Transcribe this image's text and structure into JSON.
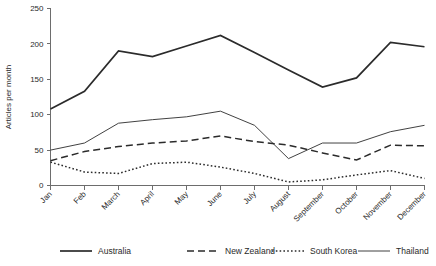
{
  "chart_data": {
    "type": "line",
    "title": "",
    "xlabel": "",
    "ylabel": "Articles per month",
    "categories": [
      "Jan",
      "Feb",
      "March",
      "April",
      "May",
      "June",
      "July",
      "August",
      "September",
      "October",
      "November",
      "December"
    ],
    "ylim": [
      0,
      250
    ],
    "yticks": [
      0,
      50,
      100,
      150,
      200,
      250
    ],
    "grid": false,
    "legend_position": "bottom",
    "series": [
      {
        "name": "Australia",
        "style": "solid-thick",
        "values": [
          108,
          133,
          190,
          182,
          197,
          212,
          188,
          163,
          139,
          152,
          202,
          196
        ]
      },
      {
        "name": "New Zealand",
        "style": "dashed",
        "values": [
          35,
          48,
          55,
          60,
          63,
          70,
          62,
          57,
          46,
          36,
          57,
          56
        ]
      },
      {
        "name": "South Korea",
        "style": "dotted",
        "values": [
          33,
          19,
          17,
          31,
          33,
          26,
          17,
          5,
          8,
          15,
          21,
          10
        ]
      },
      {
        "name": "Thailand",
        "style": "solid-thin",
        "values": [
          50,
          60,
          88,
          93,
          97,
          105,
          85,
          38,
          60,
          60,
          76,
          85
        ]
      }
    ]
  },
  "legend": {
    "items": [
      {
        "label": "Australia"
      },
      {
        "label": "New Zealand"
      },
      {
        "label": "South Korea"
      },
      {
        "label": "Thailand"
      }
    ]
  }
}
